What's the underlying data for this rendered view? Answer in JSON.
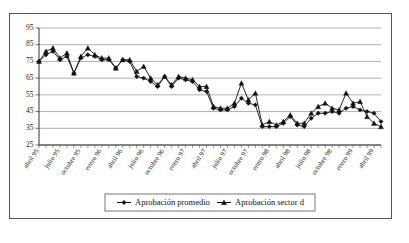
{
  "chart_data": {
    "type": "line",
    "title": "",
    "subtitle": "",
    "xlabel": "",
    "ylabel": "",
    "ylim": [
      25,
      95
    ],
    "yticks": [
      25,
      35,
      45,
      55,
      65,
      75,
      85,
      95
    ],
    "grid": true,
    "legend_position": "bottom",
    "x_tick_labels": [
      "abril 95",
      "julio 95",
      "octubre 95",
      "enero 96",
      "abril 96",
      "julio 96",
      "octubre 96",
      "enero 97",
      "abril 97",
      "julio 97",
      "octubre 97",
      "enero 98",
      "abril 98",
      "julio 98",
      "octubre 98",
      "enero 99",
      "abril 99"
    ],
    "x_tick_every": 3,
    "x": [
      "abril 95",
      "mayo 95",
      "junio 95",
      "julio 95",
      "agosto 95",
      "septiembre 95",
      "octubre 95",
      "noviembre 95",
      "diciembre 95",
      "enero 96",
      "febrero 96",
      "marzo 96",
      "abril 96",
      "mayo 96",
      "junio 96",
      "julio 96",
      "agosto 96",
      "septiembre 96",
      "octubre 96",
      "noviembre 96",
      "diciembre 96",
      "enero 97",
      "febrero 97",
      "marzo 97",
      "abril 97",
      "mayo 97",
      "junio 97",
      "julio 97",
      "agosto 97",
      "septiembre 97",
      "octubre 97",
      "noviembre 97",
      "diciembre 97",
      "enero 98",
      "febrero 98",
      "marzo 98",
      "abril 98",
      "mayo 98",
      "junio 98",
      "julio 98",
      "agosto 98",
      "septiembre 98",
      "octubre 98",
      "noviembre 98",
      "diciembre 98",
      "enero 99",
      "febrero 99",
      "marzo 99",
      "abril 99",
      "mayo 99"
    ],
    "series": [
      {
        "name": "Aprobación promedio",
        "marker": "diamond",
        "color": "#111111",
        "values": [
          75,
          79,
          81,
          76,
          78,
          68,
          77,
          79,
          78,
          76,
          76,
          71,
          76,
          75,
          66,
          65,
          63,
          60,
          66,
          60,
          65,
          64,
          63,
          58,
          57,
          47,
          46,
          46,
          48,
          53,
          50,
          49,
          36,
          36,
          36,
          38,
          42,
          37,
          36,
          41,
          44,
          44,
          45,
          44,
          47,
          48,
          46,
          45,
          44,
          39
        ]
      },
      {
        "name": "Aprobación sector d",
        "marker": "triangle",
        "color": "#111111",
        "values": [
          75,
          81,
          83,
          77,
          80,
          68,
          78,
          83,
          79,
          77,
          77,
          71,
          76,
          76,
          69,
          72,
          65,
          61,
          66,
          61,
          66,
          65,
          64,
          60,
          60,
          48,
          47,
          47,
          50,
          62,
          52,
          56,
          37,
          39,
          37,
          39,
          43,
          38,
          38,
          44,
          48,
          50,
          47,
          46,
          56,
          50,
          51,
          42,
          38,
          36
        ]
      }
    ],
    "series_d_extra": {
      "note": ""
    }
  },
  "legend": {
    "items": [
      {
        "label": "Aprobación promedio",
        "marker": "diamond"
      },
      {
        "label": "Aprobación sector d",
        "marker": "triangle"
      }
    ]
  }
}
